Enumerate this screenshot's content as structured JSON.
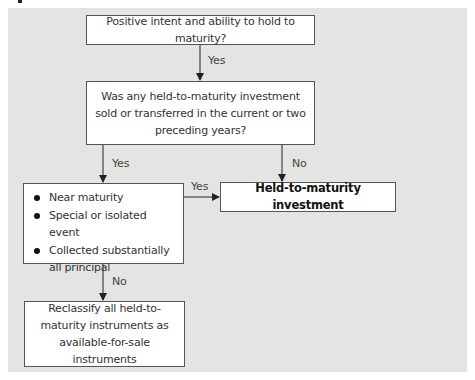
{
  "diagram": {
    "type": "flowchart",
    "colors": {
      "panel_background": "#e4e4e2",
      "box_background": "#ffffff",
      "box_border": "#555555",
      "arrow": "#222222"
    },
    "nodes": {
      "intent": {
        "text": "Positive intent and ability to hold to maturity?"
      },
      "prior_sales": {
        "text": "Was any held-to-maturity investment sold or transferred in the current or two preceding years?"
      },
      "exceptions": {
        "items": [
          "Near maturity",
          "Special or isolated event",
          "Collected substantially all principal"
        ]
      },
      "htm": {
        "text": "Held-to-maturity investment"
      },
      "reclassify": {
        "text": "Reclassify all held-to-maturity instruments as available-for-sale instruments"
      }
    },
    "edges": [
      {
        "from": "intent",
        "to": "prior_sales",
        "label": "Yes"
      },
      {
        "from": "prior_sales",
        "to": "exceptions",
        "label": "Yes"
      },
      {
        "from": "prior_sales",
        "to": "htm",
        "label": "No"
      },
      {
        "from": "exceptions",
        "to": "htm",
        "label": "Yes"
      },
      {
        "from": "exceptions",
        "to": "reclassify",
        "label": "No"
      }
    ]
  }
}
